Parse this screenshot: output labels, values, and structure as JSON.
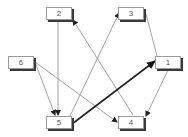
{
  "diagram": {
    "type": "directed-graph",
    "nodes": [
      {
        "id": "1",
        "label": "1",
        "x": 155,
        "y": 56
      },
      {
        "id": "2",
        "label": "2",
        "x": 46,
        "y": 7
      },
      {
        "id": "3",
        "label": "3",
        "x": 118,
        "y": 7
      },
      {
        "id": "4",
        "label": "4",
        "x": 118,
        "y": 116
      },
      {
        "id": "5",
        "label": "5",
        "x": 46,
        "y": 116
      },
      {
        "id": "6",
        "label": "6",
        "x": 8,
        "y": 56
      }
    ],
    "edges": [
      {
        "from": "2",
        "to": "5",
        "emphasis": false
      },
      {
        "from": "4",
        "to": "2",
        "emphasis": false
      },
      {
        "from": "5",
        "to": "3",
        "emphasis": false
      },
      {
        "from": "3",
        "to": "1",
        "emphasis": false
      },
      {
        "from": "5",
        "to": "1",
        "emphasis": true
      },
      {
        "from": "1",
        "to": "4",
        "emphasis": false
      },
      {
        "from": "6",
        "to": "5",
        "emphasis": false
      },
      {
        "from": "6",
        "to": "4",
        "emphasis": false
      }
    ],
    "colors": {
      "edge": "#8a8a8a",
      "emphasis_edge": "#222222",
      "node_border": "#9a9a9a",
      "node_shadow": "#3a3a3a",
      "label": "#555555"
    }
  }
}
